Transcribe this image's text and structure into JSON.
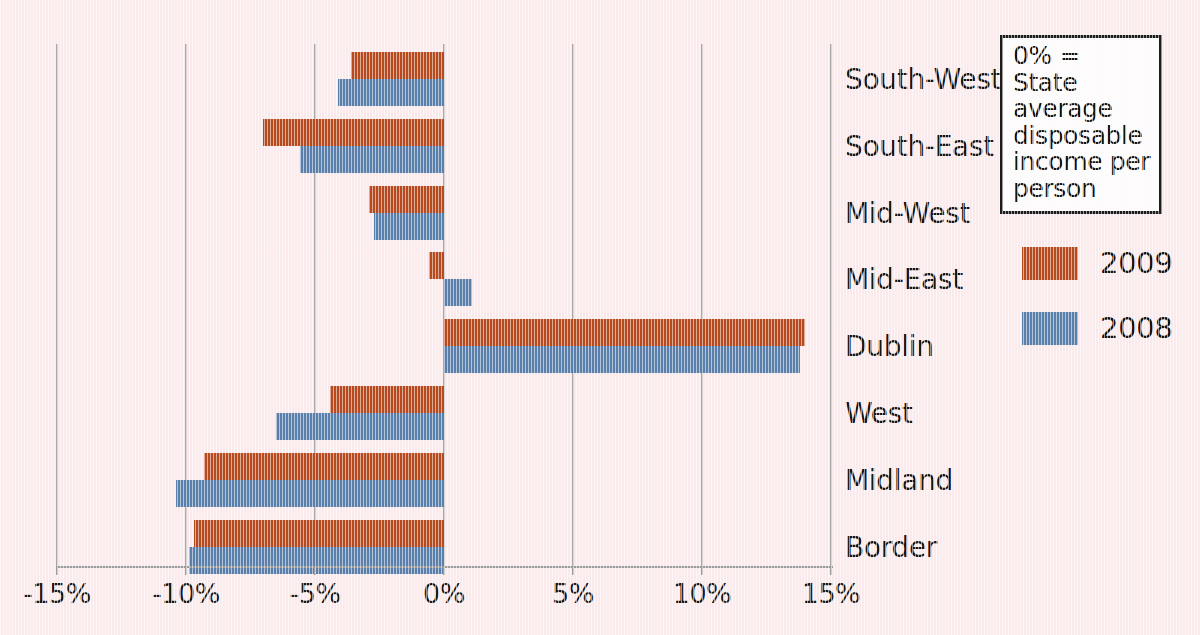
{
  "chart_data": {
    "type": "bar",
    "orientation": "horizontal",
    "title": "",
    "xlabel": "",
    "ylabel": "",
    "xlim": [
      -15,
      15
    ],
    "xticks": [
      -15,
      -10,
      -5,
      0,
      5,
      10,
      15
    ],
    "xtick_labels": [
      "-15%",
      "-10%",
      "-5%",
      "0%",
      "5%",
      "10%",
      "15%"
    ],
    "grid": true,
    "legend_position": "right",
    "categories": [
      "South-West",
      "South-East",
      "Mid-West",
      "Mid-East",
      "Dublin",
      "West",
      "Midland",
      "Border"
    ],
    "series": [
      {
        "name": "2009",
        "color": "#b64a1e",
        "values": [
          -3.6,
          -7.0,
          -2.9,
          -0.6,
          14.0,
          -4.4,
          -9.3,
          -9.7
        ]
      },
      {
        "name": "2008",
        "color": "#5b7fab",
        "values": [
          -4.1,
          -5.6,
          -2.7,
          1.1,
          13.8,
          -6.5,
          -10.4,
          -9.9
        ]
      }
    ],
    "annotation": "0% = State average disposable income per person"
  },
  "note": {
    "text": "0% = State average disposable income per person"
  },
  "legend": {
    "entries": [
      {
        "label": "2009",
        "color": "#b64a1e"
      },
      {
        "label": "2008",
        "color": "#5b7fab"
      }
    ]
  },
  "colors": {
    "background": "#fbeaec",
    "gridline": "#a9a9a9",
    "axis": "#9b9b9b",
    "series_2009": "#b64a1e",
    "series_2008": "#5b7fab",
    "text": "#171717"
  }
}
